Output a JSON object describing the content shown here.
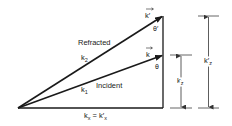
{
  "diagram": {
    "type": "wave-vector refraction diagram",
    "colors": {
      "line": "#1a1a1a",
      "dim_line": "#555555",
      "text": "#222222",
      "background": "#ffffff"
    },
    "vectors": [
      {
        "id": "refracted",
        "label": "Refracted",
        "magnitude_label": "k₂",
        "vector_label": "k′",
        "angle_label": "θ′"
      },
      {
        "id": "incident",
        "label": "Incident",
        "magnitude_label": "k₁",
        "vector_label": "k",
        "angle_label": "θ"
      }
    ],
    "labels": {
      "refracted": "Refracted",
      "incident": "Incident",
      "k2": "k",
      "k2_sub": "2",
      "k1": "k",
      "k1_sub": "1",
      "kvec_prime": "k′",
      "kvec": "k",
      "theta_prime": "θ′",
      "theta": "θ",
      "kx_base": "k",
      "kx_sub": "x",
      "kx_eq": " = k′",
      "kx_sub2": "x",
      "kz": "k",
      "kz_sub": "z",
      "kz_prime": "k′",
      "kz_prime_sub": "z"
    }
  }
}
